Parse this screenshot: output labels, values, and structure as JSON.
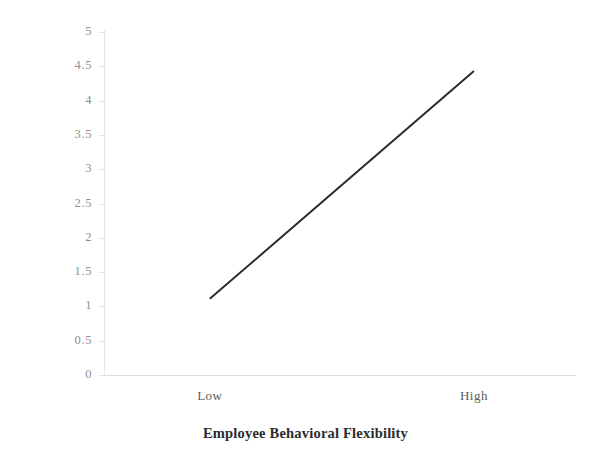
{
  "chart_data": {
    "type": "line",
    "title": "",
    "xlabel": "Employee Behavioral Flexibility",
    "ylabel": "Flexible HR Systems",
    "categories": [
      "Low",
      "High"
    ],
    "x": [
      0,
      1
    ],
    "series": [
      {
        "name": "Flexible HR Systems",
        "values": [
          1.11,
          4.43
        ],
        "color": "#2b2b2b",
        "line_width": 2
      }
    ],
    "xlim": [
      0,
      1
    ],
    "ylim": [
      0,
      5
    ],
    "yticks": [
      0,
      0.5,
      1,
      1.5,
      2,
      2.5,
      3,
      3.5,
      4,
      4.5,
      5
    ],
    "ytick_labels": [
      "0",
      "0.5",
      "1",
      "1.5",
      "2",
      "2.5",
      "3",
      "3.5",
      "4",
      "4.5",
      "5"
    ],
    "xtick_labels": [
      "Low",
      "High"
    ],
    "xtick_positions": [
      0.223,
      0.785
    ],
    "grid": false,
    "legend": false,
    "legend_position": "none",
    "background_color": "#ffffff",
    "axis_color": "#e0e0e0",
    "tick_label_color": "#8f8f8f",
    "title_color": "#2c2c2c"
  }
}
